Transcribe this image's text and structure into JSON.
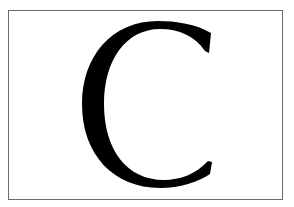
{
  "card": {
    "letter": "C",
    "border_color": "#6b6b6b",
    "background_color": "#ffffff",
    "letter_color": "#000000"
  }
}
